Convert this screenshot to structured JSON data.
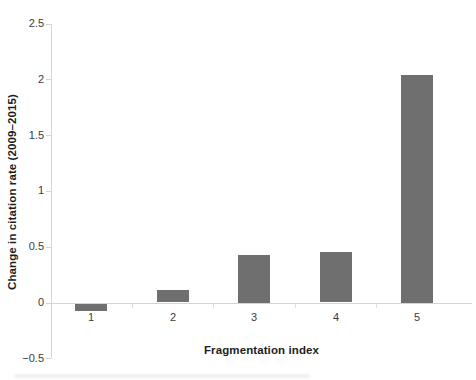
{
  "figure": {
    "background": "#ffffff"
  },
  "chart_data": {
    "type": "bar",
    "title": "",
    "xlabel": "Fragmentation index",
    "ylabel": "Change in citation rate (2009–2015)",
    "categories": [
      "1",
      "2",
      "3",
      "4",
      "5"
    ],
    "values": [
      -0.06,
      0.11,
      0.43,
      0.45,
      2.04
    ],
    "ylim": [
      -0.5,
      2.5
    ],
    "ytick_step": 0.5,
    "ytick_labels": [
      "−0.5",
      "0",
      "0.5",
      "1",
      "1.5",
      "2",
      "2.5"
    ],
    "grid": false,
    "legend": "none",
    "bar_color": "#6f6f6f",
    "axis_color": "#d4d4d4",
    "tick_label_color": "#3a3a3a"
  }
}
